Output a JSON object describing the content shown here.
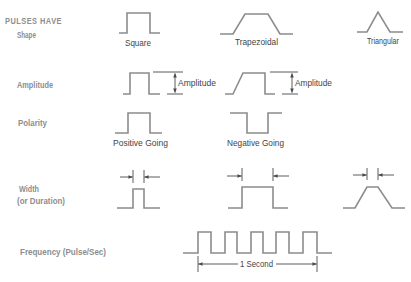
{
  "title": "PULSES HAVE",
  "rows": {
    "shape": {
      "label": "Shape",
      "items": [
        "Square",
        "Trapezoidal",
        "Triangular"
      ]
    },
    "amplitude": {
      "label": "Amplitude",
      "items": [
        "Amplitude",
        "Amplitude"
      ]
    },
    "polarity": {
      "label": "Polarity",
      "items": [
        "Positive Going",
        "Negative Going"
      ]
    },
    "width": {
      "label_line1": "Width",
      "label_line2": "(or Duration)"
    },
    "frequency": {
      "label": "Frequency (Pulse/Sec)",
      "pulse_count": 5,
      "span_label": "1 Second"
    }
  },
  "colors": {
    "waveform": "#8c8c8c",
    "row_label": "#8e8e8e",
    "annotation_text": "#444444"
  }
}
